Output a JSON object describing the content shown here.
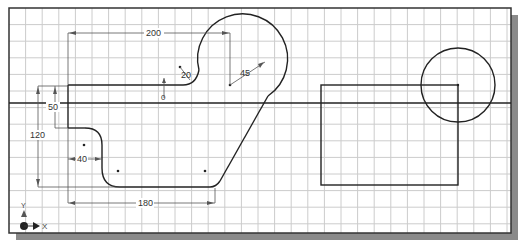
{
  "canvas": {
    "background": "#ffffff",
    "frame": {
      "x": 9,
      "y": 8,
      "w": 502,
      "h": 225,
      "stroke": "#333333"
    },
    "shadow": {
      "color": "#8a8a8a",
      "offset": 7
    },
    "grid": {
      "spacing": 16.6,
      "color": "#c9c9c9",
      "origin_x": 9,
      "origin_y": 8
    }
  },
  "axis_line": {
    "y": 103
  },
  "ucs_icon": {
    "y_label": "Y",
    "x_label": "X"
  },
  "dimensions": {
    "d200": "200",
    "d20": "R20",
    "d20_text": "20",
    "d45": "45",
    "d50": "50",
    "d120": "120",
    "d40": "40",
    "d180": "180",
    "d0": "0"
  },
  "shapes": {
    "profile": "open wrench-like profile with arcs R20 and R45",
    "rectangle": {
      "x": 321,
      "y": 85,
      "w": 137,
      "h": 100
    },
    "circle": {
      "cx": 458,
      "cy": 85,
      "r": 37
    }
  }
}
